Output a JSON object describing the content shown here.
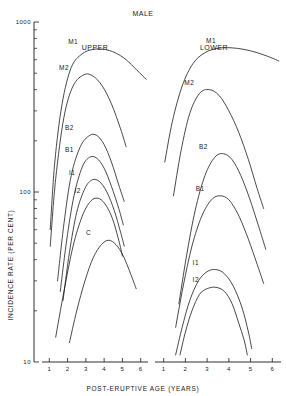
{
  "chart_data": {
    "type": "line",
    "title": "MALE",
    "xlabel": "POST-ERUPTIVE AGE (YEARS)",
    "ylabel": "INCIDENCE RATE (PER CENT)",
    "yscale": "log",
    "ylim": [
      10,
      1000
    ],
    "ytick_labels": [
      "1000",
      "100",
      "10"
    ],
    "ytick_values": [
      1000,
      100,
      10
    ],
    "grid": false,
    "legend": "inline curve labels",
    "panels": [
      {
        "name": "UPPER",
        "label": "UPPER",
        "xlim": [
          0.6,
          6.4
        ],
        "xtick_labels": [
          "1",
          "2",
          "3",
          "4",
          "5",
          "6"
        ],
        "xtick_values": [
          1,
          2,
          3,
          4,
          5,
          6
        ],
        "series": [
          {
            "name": "M1",
            "label": "M1",
            "x": [
              1.05,
              1.3,
              1.7,
              2.2,
              2.8,
              3.4,
              4.0,
              4.6,
              5.2,
              5.8,
              6.3
            ],
            "y": [
              60,
              150,
              330,
              540,
              650,
              690,
              690,
              660,
              600,
              520,
              460
            ]
          },
          {
            "name": "M2",
            "label": "M2",
            "x": [
              1.05,
              1.35,
              1.8,
              2.3,
              2.9,
              3.4,
              3.9,
              4.4,
              4.9,
              5.2
            ],
            "y": [
              48,
              120,
              275,
              420,
              490,
              480,
              420,
              330,
              235,
              185
            ]
          },
          {
            "name": "B2",
            "label": "B2",
            "x": [
              1.45,
              1.8,
              2.2,
              2.7,
              3.2,
              3.6,
              4.0,
              4.4,
              4.8,
              5.1
            ],
            "y": [
              30,
              65,
              125,
              185,
              215,
              215,
              190,
              150,
              110,
              88
            ]
          },
          {
            "name": "B1",
            "label": "B1",
            "x": [
              1.6,
              1.95,
              2.35,
              2.8,
              3.2,
              3.6,
              4.0,
              4.4,
              4.8,
              5.05
            ],
            "y": [
              26,
              52,
              95,
              140,
              160,
              158,
              138,
              108,
              80,
              64
            ]
          },
          {
            "name": "I1",
            "label": "I1",
            "x": [
              1.75,
              2.1,
              2.5,
              2.95,
              3.35,
              3.75,
              4.15,
              4.55,
              4.9,
              5.1
            ],
            "y": [
              23,
              44,
              76,
              105,
              118,
              115,
              100,
              78,
              58,
              48
            ]
          },
          {
            "name": "I2",
            "label": "I2",
            "x": [
              1.35,
              1.8,
              2.3,
              2.8,
              3.25,
              3.65,
              4.05,
              4.45,
              4.8,
              5.0
            ],
            "y": [
              14,
              26,
              48,
              72,
              88,
              92,
              85,
              70,
              52,
              42
            ]
          },
          {
            "name": "C",
            "label": "C",
            "x": [
              2.1,
              2.5,
              2.95,
              3.4,
              3.85,
              4.25,
              4.65,
              5.05,
              5.45,
              5.75
            ],
            "y": [
              13,
              20,
              30,
              41,
              49,
              52,
              49,
              42,
              33,
              27
            ]
          }
        ]
      },
      {
        "name": "LOWER",
        "label": "LOWER",
        "xlim": [
          0.6,
          6.4
        ],
        "xtick_labels": [
          "1",
          "2",
          "3",
          "4",
          "5",
          "6"
        ],
        "xtick_values": [
          1,
          2,
          3,
          4,
          5,
          6
        ],
        "series": [
          {
            "name": "M1",
            "label": "M1",
            "x": [
              1.05,
              1.4,
              1.85,
              2.35,
              2.9,
              3.5,
              4.1,
              4.7,
              5.3,
              5.9,
              6.3
            ],
            "y": [
              150,
              260,
              420,
              570,
              660,
              700,
              705,
              690,
              660,
              620,
              590
            ]
          },
          {
            "name": "M2",
            "label": "M2",
            "x": [
              1.45,
              1.8,
              2.2,
              2.65,
              3.1,
              3.55,
              4.0,
              4.45,
              4.9,
              5.3,
              5.6
            ],
            "y": [
              95,
              175,
              290,
              380,
              400,
              370,
              300,
              225,
              155,
              105,
              80
            ]
          },
          {
            "name": "B2",
            "label": "B2",
            "x": [
              1.7,
              2.05,
              2.45,
              2.9,
              3.35,
              3.75,
              4.15,
              4.55,
              4.95,
              5.35,
              5.7
            ],
            "y": [
              22,
              42,
              78,
              125,
              160,
              168,
              155,
              125,
              92,
              64,
              46
            ]
          },
          {
            "name": "B1",
            "label": "B1",
            "x": [
              1.55,
              1.9,
              2.3,
              2.75,
              3.2,
              3.6,
              4.0,
              4.4,
              4.8,
              5.2,
              5.6
            ],
            "y": [
              16,
              28,
              48,
              72,
              90,
              95,
              90,
              75,
              57,
              41,
              29
            ]
          },
          {
            "name": "I1",
            "label": "I1",
            "x": [
              1.55,
              1.85,
              2.2,
              2.6,
              3.0,
              3.4,
              3.8,
              4.2,
              4.6,
              4.9,
              5.05
            ],
            "y": [
              11,
              16,
              23,
              30,
              34,
              35,
              33,
              28,
              21,
              15,
              12
            ]
          },
          {
            "name": "I2",
            "label": "I2",
            "x": [
              1.75,
              2.0,
              2.3,
              2.65,
              3.0,
              3.4,
              3.8,
              4.15,
              4.45,
              4.7,
              4.85
            ],
            "y": [
              11,
              15,
              20,
              25,
              27,
              27.5,
              26,
              22,
              17,
              13.5,
              11
            ]
          }
        ]
      }
    ]
  }
}
